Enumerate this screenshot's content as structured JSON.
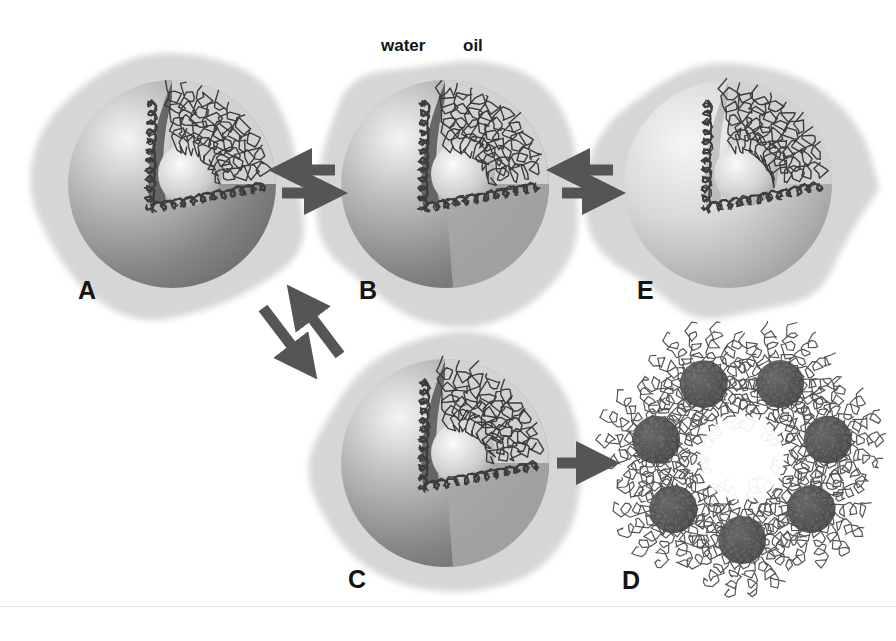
{
  "figure": {
    "type": "schematic",
    "phase_labels": {
      "water": "water",
      "oil": "oil"
    },
    "panels": [
      {
        "id": "A",
        "label": "A",
        "cx": 172,
        "cy": 184,
        "r": 104
      },
      {
        "id": "B",
        "label": "B",
        "cx": 445,
        "cy": 184,
        "r": 104
      },
      {
        "id": "E",
        "label": "E",
        "cx": 728,
        "cy": 184,
        "r": 104
      },
      {
        "id": "C",
        "label": "C",
        "cx": 445,
        "cy": 463,
        "r": 104
      },
      {
        "id": "D",
        "label": "D",
        "cx": 742,
        "cy": 458
      }
    ],
    "arrows": [
      {
        "from": "A",
        "to": "B",
        "type": "equilibrium-horizontal"
      },
      {
        "from": "B",
        "to": "E",
        "type": "equilibrium-horizontal"
      },
      {
        "from": "A",
        "to": "C",
        "type": "equilibrium-diagonal"
      },
      {
        "from": "C",
        "to": "D",
        "type": "forward"
      }
    ],
    "colors": {
      "background": "#ffffff",
      "halo": "#d2d2d2",
      "sphere_dark": "#7a7a7a",
      "sphere_light": "#efefef",
      "polymer_line": "#3c3c3c",
      "arrow": "#555555",
      "aggregate_core": "#4d4d4d"
    }
  }
}
